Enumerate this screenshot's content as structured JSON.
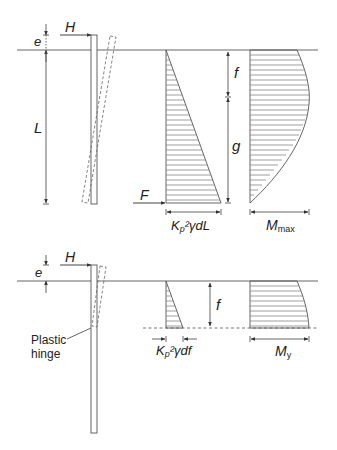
{
  "figure": {
    "top_panel": {
      "labels": {
        "e": "e",
        "H": "H",
        "L": "L",
        "F": "F",
        "f": "f",
        "g": "g",
        "pressure_width": "K",
        "pressure_width_sub": "p",
        "pressure_width_rest": "²γdL",
        "moment_width": "M",
        "moment_width_sub": "max"
      }
    },
    "bottom_panel": {
      "labels": {
        "e": "e",
        "H": "H",
        "f": "f",
        "hinge_line1": "Plastic",
        "hinge_line2": "hinge",
        "pressure_width": "K",
        "pressure_width_sub": "p",
        "pressure_width_rest": "²γdf",
        "moment_width": "M",
        "moment_width_sub": "y"
      }
    },
    "colors": {
      "line": "#555555",
      "text": "#222222",
      "background": "#ffffff"
    }
  }
}
